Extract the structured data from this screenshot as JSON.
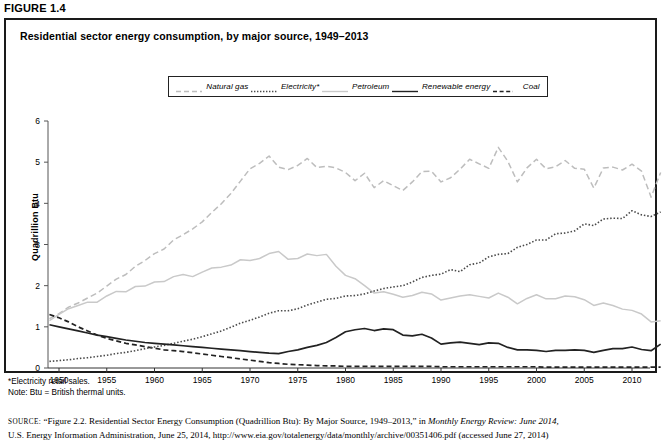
{
  "figure": {
    "label": "FIGURE 1.4",
    "title": "Residential sector energy consumption, by major source, 1949–2013"
  },
  "legend": {
    "position": "top-center",
    "items": [
      {
        "label": "Natural gas",
        "style": "dashed-light",
        "color": "#bdbdbd",
        "name": "legend-natural-gas"
      },
      {
        "label": "Electricity*",
        "style": "dotted-dark",
        "color": "#4a4a4a",
        "name": "legend-electricity"
      },
      {
        "label": "Petroleum",
        "style": "solid-light",
        "color": "#c9c9c9",
        "name": "legend-petroleum"
      },
      {
        "label": "Renewable energy",
        "style": "solid-dark",
        "color": "#222222",
        "name": "legend-renewable-energy"
      },
      {
        "label": "Coal",
        "style": "dashed-dark",
        "color": "#222222",
        "name": "legend-coal"
      }
    ]
  },
  "notes": {
    "footnote": "*Electricity retail sales.",
    "note": "Note: Btu = British thermal units."
  },
  "source": {
    "prefix": "SOURCE:",
    "line1_a": "“Figure 2.2. Residential Sector Energy Consumption (Quadrillion Btu): By Major Source, 1949–2013,” in ",
    "line1_em": "Monthly Energy Review: June 2014,",
    "line2": "U.S. Energy Information Administration, June 25, 2014, http://www.eia.gov/totalenergy/data/monthly/archive/00351406.pdf (accessed June 27, 2014)"
  },
  "chart_data": {
    "type": "line",
    "title": "Residential sector energy consumption, by major source, 1949–2013",
    "xlabel": "",
    "ylabel": "Quadrillion Btu",
    "xlim": [
      1949,
      2013
    ],
    "ylim": [
      0,
      6
    ],
    "yticks": [
      0,
      1,
      2,
      3,
      4,
      5,
      6
    ],
    "xticks": [
      1950,
      1955,
      1960,
      1965,
      1970,
      1975,
      1980,
      1985,
      1990,
      1995,
      2000,
      2005,
      2010
    ],
    "grid": false,
    "x": [
      1949,
      1950,
      1951,
      1952,
      1953,
      1954,
      1955,
      1956,
      1957,
      1958,
      1959,
      1960,
      1961,
      1962,
      1963,
      1964,
      1965,
      1966,
      1967,
      1968,
      1969,
      1970,
      1971,
      1972,
      1973,
      1974,
      1975,
      1976,
      1977,
      1978,
      1979,
      1980,
      1981,
      1982,
      1983,
      1984,
      1985,
      1986,
      1987,
      1988,
      1989,
      1990,
      1991,
      1992,
      1993,
      1994,
      1995,
      1996,
      1997,
      1998,
      1999,
      2000,
      2001,
      2002,
      2003,
      2004,
      2005,
      2006,
      2007,
      2008,
      2009,
      2010,
      2011,
      2012,
      2013
    ],
    "series": [
      {
        "name": "Natural gas",
        "style": "dashed-light",
        "color": "#bdbdbd",
        "values": [
          1.2,
          1.32,
          1.48,
          1.58,
          1.7,
          1.82,
          1.99,
          2.16,
          2.27,
          2.47,
          2.61,
          2.78,
          2.89,
          3.11,
          3.24,
          3.38,
          3.55,
          3.78,
          3.99,
          4.24,
          4.54,
          4.84,
          4.97,
          5.15,
          4.88,
          4.82,
          4.92,
          5.09,
          4.87,
          4.9,
          4.86,
          4.75,
          4.55,
          4.73,
          4.38,
          4.55,
          4.43,
          4.31,
          4.52,
          4.77,
          4.78,
          4.52,
          4.62,
          4.83,
          5.07,
          4.96,
          4.85,
          5.36,
          5.02,
          4.52,
          4.86,
          5.07,
          4.84,
          4.89,
          5.04,
          4.85,
          4.83,
          4.37,
          4.86,
          4.88,
          4.81,
          4.95,
          4.78,
          4.15,
          4.75
        ]
      },
      {
        "name": "Electricity*",
        "style": "dotted-dark",
        "color": "#4a4a4a",
        "values": [
          0.16,
          0.18,
          0.2,
          0.23,
          0.25,
          0.28,
          0.31,
          0.35,
          0.38,
          0.42,
          0.47,
          0.51,
          0.55,
          0.6,
          0.65,
          0.7,
          0.76,
          0.83,
          0.9,
          0.99,
          1.09,
          1.16,
          1.24,
          1.33,
          1.39,
          1.39,
          1.44,
          1.53,
          1.6,
          1.67,
          1.69,
          1.75,
          1.76,
          1.8,
          1.87,
          1.93,
          1.97,
          2.0,
          2.09,
          2.2,
          2.25,
          2.28,
          2.39,
          2.34,
          2.51,
          2.55,
          2.7,
          2.76,
          2.78,
          2.93,
          3.0,
          3.11,
          3.11,
          3.26,
          3.28,
          3.33,
          3.5,
          3.46,
          3.62,
          3.64,
          3.63,
          3.82,
          3.72,
          3.68,
          3.79
        ]
      },
      {
        "name": "Petroleum",
        "style": "solid-light",
        "color": "#c9c9c9",
        "values": [
          1.15,
          1.3,
          1.44,
          1.52,
          1.6,
          1.6,
          1.75,
          1.86,
          1.85,
          1.98,
          1.99,
          2.09,
          2.1,
          2.22,
          2.27,
          2.22,
          2.33,
          2.43,
          2.45,
          2.5,
          2.63,
          2.61,
          2.66,
          2.78,
          2.83,
          2.64,
          2.66,
          2.77,
          2.73,
          2.76,
          2.47,
          2.25,
          2.17,
          2.0,
          1.82,
          1.85,
          1.79,
          1.72,
          1.76,
          1.84,
          1.8,
          1.65,
          1.7,
          1.75,
          1.78,
          1.74,
          1.7,
          1.82,
          1.72,
          1.56,
          1.69,
          1.78,
          1.68,
          1.68,
          1.75,
          1.73,
          1.66,
          1.52,
          1.58,
          1.52,
          1.43,
          1.4,
          1.31,
          1.12,
          1.15
        ]
      },
      {
        "name": "Renewable energy",
        "style": "solid-dark",
        "color": "#222222",
        "values": [
          1.05,
          1.0,
          0.95,
          0.9,
          0.85,
          0.8,
          0.76,
          0.72,
          0.68,
          0.65,
          0.62,
          0.6,
          0.58,
          0.56,
          0.54,
          0.52,
          0.5,
          0.48,
          0.46,
          0.44,
          0.42,
          0.4,
          0.38,
          0.36,
          0.35,
          0.4,
          0.44,
          0.5,
          0.55,
          0.62,
          0.74,
          0.88,
          0.93,
          0.96,
          0.91,
          0.95,
          0.93,
          0.8,
          0.78,
          0.82,
          0.73,
          0.58,
          0.61,
          0.63,
          0.6,
          0.57,
          0.61,
          0.6,
          0.5,
          0.44,
          0.44,
          0.43,
          0.4,
          0.43,
          0.43,
          0.44,
          0.43,
          0.38,
          0.43,
          0.47,
          0.47,
          0.51,
          0.45,
          0.42,
          0.58
        ]
      },
      {
        "name": "Coal",
        "style": "dashed-dark",
        "color": "#222222",
        "values": [
          1.3,
          1.22,
          1.12,
          1.0,
          0.9,
          0.8,
          0.72,
          0.66,
          0.6,
          0.56,
          0.52,
          0.48,
          0.44,
          0.42,
          0.4,
          0.37,
          0.34,
          0.31,
          0.28,
          0.25,
          0.22,
          0.19,
          0.16,
          0.13,
          0.11,
          0.09,
          0.08,
          0.07,
          0.06,
          0.05,
          0.05,
          0.04,
          0.04,
          0.04,
          0.04,
          0.04,
          0.04,
          0.04,
          0.04,
          0.04,
          0.04,
          0.03,
          0.03,
          0.03,
          0.03,
          0.03,
          0.03,
          0.03,
          0.03,
          0.03,
          0.03,
          0.03,
          0.02,
          0.02,
          0.02,
          0.02,
          0.02,
          0.02,
          0.02,
          0.02,
          0.02,
          0.02,
          0.02,
          0.02,
          0.02
        ]
      }
    ]
  }
}
